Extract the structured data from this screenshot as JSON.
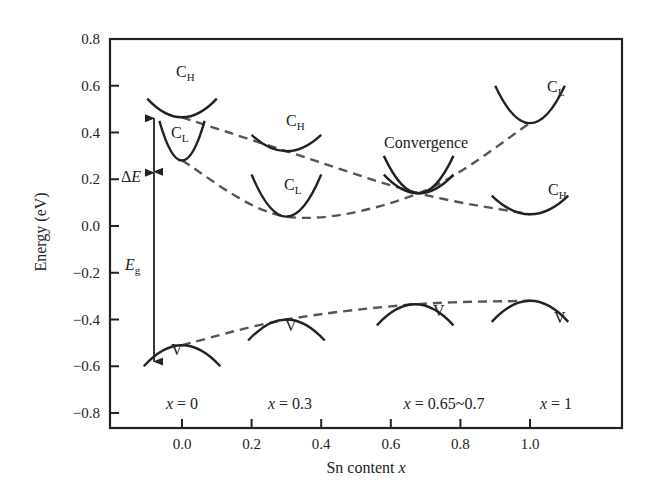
{
  "chart_data": {
    "type": "line",
    "title": "",
    "xlabel": "Sn content x",
    "ylabel": "Energy (eV)",
    "xlim": [
      -0.2,
      1.18
    ],
    "ylim": [
      -0.85,
      0.8
    ],
    "x_ticks": [
      0.0,
      0.2,
      0.4,
      0.6,
      0.8,
      1.0
    ],
    "x_tick_labels": [
      "0.0",
      "0.2",
      "0.4",
      "0.6",
      "0.8",
      "1.0"
    ],
    "y_ticks": [
      0.8,
      0.6,
      0.4,
      0.2,
      0.0,
      -0.2,
      -0.4,
      -0.6,
      -0.8
    ],
    "y_tick_labels": [
      "0.8",
      "0.6",
      "0.4",
      "0.2",
      "0.0",
      "−0.2",
      "−0.4",
      "−0.6",
      "−0.8"
    ],
    "grid": false,
    "legend": "none",
    "series": [
      {
        "name": "C_H band edge (dashed trend)",
        "style": "dashed",
        "x": [
          0.0,
          0.3,
          0.68,
          1.0
        ],
        "values": [
          0.465,
          0.32,
          0.14,
          0.05
        ]
      },
      {
        "name": "C_L band edge (dashed trend)",
        "style": "dashed",
        "x": [
          0.0,
          0.3,
          0.68,
          1.0
        ],
        "values": [
          0.28,
          0.04,
          0.14,
          0.44
        ]
      },
      {
        "name": "V band edge (dashed trend)",
        "style": "dashed",
        "x": [
          0.0,
          0.3,
          0.67,
          1.0
        ],
        "values": [
          -0.51,
          -0.4,
          -0.335,
          -0.32
        ]
      }
    ],
    "band_sketches": [
      {
        "label": "C_H",
        "x": 0.0,
        "y": 0.465,
        "shape": "up",
        "width": 0.2,
        "depth": 0.08
      },
      {
        "label": "C_L",
        "x": 0.0,
        "y": 0.28,
        "shape": "up",
        "width": 0.13,
        "depth": 0.17
      },
      {
        "label": "C_H",
        "x": 0.3,
        "y": 0.32,
        "shape": "up",
        "width": 0.2,
        "depth": 0.07
      },
      {
        "label": "C_L",
        "x": 0.3,
        "y": 0.04,
        "shape": "up",
        "width": 0.2,
        "depth": 0.18
      },
      {
        "label": "C_H",
        "x": 0.68,
        "y": 0.14,
        "shape": "up",
        "width": 0.2,
        "depth": 0.08
      },
      {
        "label": "C_L",
        "x": 0.68,
        "y": 0.14,
        "shape": "up",
        "width": 0.2,
        "depth": 0.16
      },
      {
        "label": "C_L",
        "x": 1.0,
        "y": 0.44,
        "shape": "up",
        "width": 0.2,
        "depth": 0.16
      },
      {
        "label": "C_H",
        "x": 1.0,
        "y": 0.05,
        "shape": "up",
        "width": 0.22,
        "depth": 0.08
      },
      {
        "label": "V",
        "x": 0.0,
        "y": -0.51,
        "shape": "down",
        "width": 0.22,
        "depth": 0.09
      },
      {
        "label": "V",
        "x": 0.3,
        "y": -0.4,
        "shape": "down",
        "width": 0.22,
        "depth": 0.09
      },
      {
        "label": "V",
        "x": 0.67,
        "y": -0.335,
        "shape": "down",
        "width": 0.22,
        "depth": 0.09
      },
      {
        "label": "V",
        "x": 1.0,
        "y": -0.32,
        "shape": "down",
        "width": 0.22,
        "depth": 0.09
      }
    ],
    "annotations": [
      {
        "text": "Convergence",
        "x": 0.68,
        "y": 0.21
      },
      {
        "text": "ΔE",
        "meaning": "energy offset between C_H and C_L at x=0",
        "x": -0.12,
        "y_from": 0.23,
        "y_to": 0.47
      },
      {
        "text": "E_g",
        "meaning": "band gap at x=0",
        "x": -0.12,
        "y_from": 0.23,
        "y_to": -0.58
      },
      {
        "text": "x = 0",
        "x": 0.0,
        "y": -0.76
      },
      {
        "text": "x = 0.3",
        "x": 0.3,
        "y": -0.76
      },
      {
        "text": "x = 0.65~0.7",
        "x": 0.67,
        "y": -0.76
      },
      {
        "text": "x = 1",
        "x": 1.0,
        "y": -0.76
      }
    ]
  },
  "labels": {
    "ylabel": "Energy (eV)",
    "xlabel_prefix": "Sn content ",
    "xlabel_var": "x",
    "convergence": "Convergence",
    "delta": "Δ",
    "E": "E",
    "g": "g",
    "C": "C",
    "H": "H",
    "L": "L",
    "V": "V",
    "x_eq": [
      "x = 0",
      "x = 0.3",
      "x = 0.65~0.7",
      "x = 1"
    ]
  },
  "colors": {
    "ink": "#222222",
    "dash": "#555555",
    "background": "#ffffff"
  }
}
